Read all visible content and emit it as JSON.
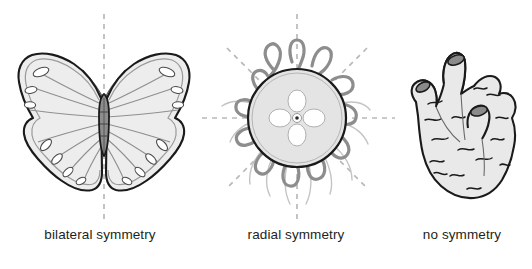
{
  "figure": {
    "background_color": "#ffffff",
    "width": 532,
    "height": 269
  },
  "panels": [
    {
      "id": "bilateral",
      "caption": "bilateral symmetry",
      "organism": "butterfly",
      "symmetry_axes": 1,
      "axis_orientations": [
        "vertical"
      ]
    },
    {
      "id": "radial",
      "caption": "radial symmetry",
      "organism": "jellyfish",
      "symmetry_axes": 4,
      "axis_orientations": [
        "vertical",
        "horizontal",
        "diagonal-45",
        "diagonal-135"
      ]
    },
    {
      "id": "none",
      "caption": "no symmetry",
      "organism": "sponge",
      "symmetry_axes": 0,
      "axis_orientations": []
    }
  ],
  "colors": {
    "axis_line": "#b9b9b9",
    "outline_dark": "#1a1a1a",
    "body_fill": "#e8e8e8",
    "wing_fill": "#ededed",
    "vein_gray": "#8f8f8f",
    "tentacle_gray": "#8d8d8d",
    "tentacle_light": "#c2c2c2",
    "osculum_fill": "#8a8a8a",
    "caption_text": "#231f20"
  },
  "labels": {
    "bilateral": "bilateral symmetry",
    "radial": "radial symmetry",
    "no_symmetry": "no symmetry"
  }
}
